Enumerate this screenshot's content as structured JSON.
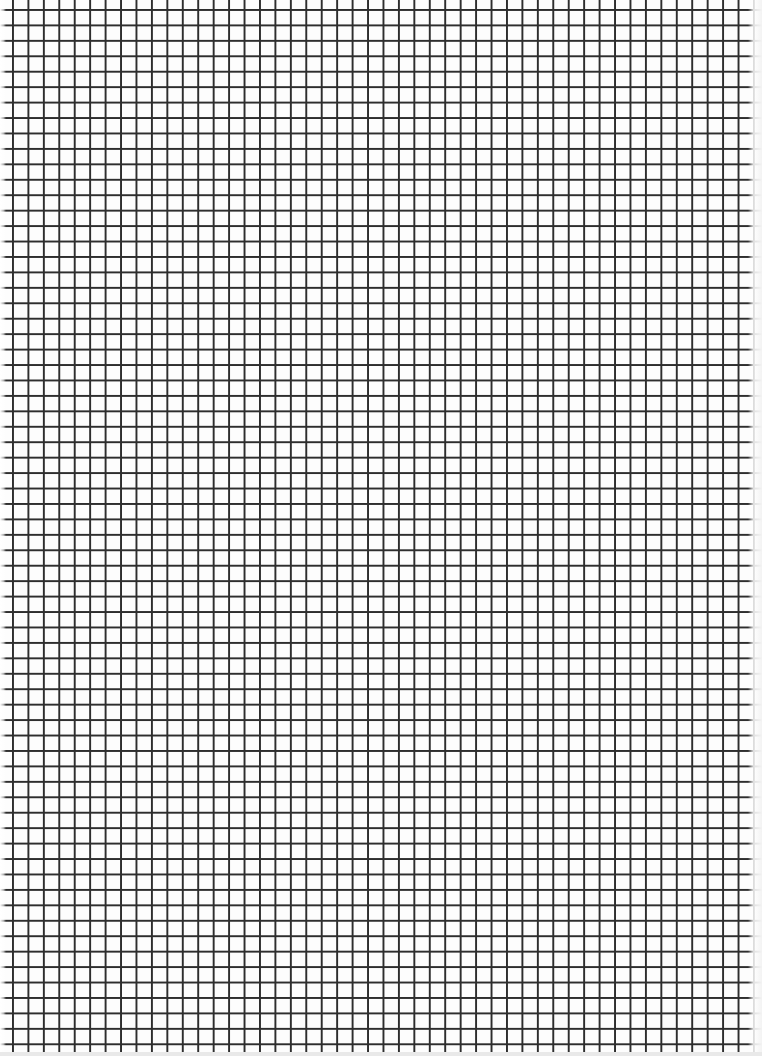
{
  "page": {
    "type": "graph paper sheet",
    "grid": {
      "cell_size_px": 15.45,
      "columns": 49,
      "rows": 68,
      "line_color": "#2e2e2e",
      "paper_color": "#fdfdfd"
    },
    "margin_print": ""
  }
}
